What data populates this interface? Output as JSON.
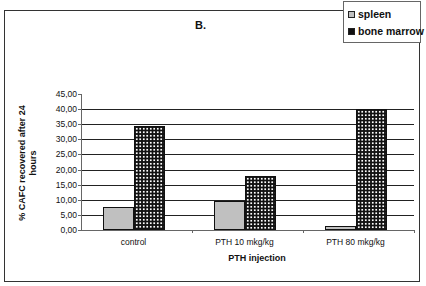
{
  "chart_data": {
    "type": "bar",
    "title": "B.",
    "xlabel": "PTH injection",
    "ylabel": "% CAFC recovered after 24 hours",
    "categories": [
      "control",
      "PTH 10 mkg/kg",
      "PTH 80 mkg/kg"
    ],
    "series": [
      {
        "name": "spleen",
        "values": [
          7.5,
          9.5,
          1.3
        ],
        "color": "#c0c0c0",
        "pattern": "solid"
      },
      {
        "name": "bone marrow",
        "values": [
          34.5,
          17.8,
          40.2
        ],
        "color": "#111111",
        "pattern": "dotted-checker"
      }
    ],
    "ylim": [
      0,
      45
    ],
    "yticks": [
      "0,00",
      "5,00",
      "10,00",
      "15,00",
      "20,00",
      "25,00",
      "30,00",
      "35,00",
      "40,00",
      "45,00"
    ],
    "grid": true,
    "legend_position": "top-right"
  },
  "legend": {
    "items": [
      {
        "label": "spleen"
      },
      {
        "label": "bone marrow"
      }
    ]
  }
}
